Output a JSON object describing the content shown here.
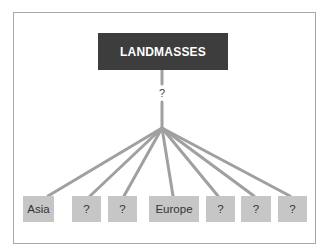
{
  "diagram": {
    "root": {
      "label": "LANDMASSES"
    },
    "relation_label": "?",
    "leaves": [
      {
        "label": "Asia"
      },
      {
        "label": "?"
      },
      {
        "label": "?"
      },
      {
        "label": "Europe"
      },
      {
        "label": "?"
      },
      {
        "label": "?"
      },
      {
        "label": "?"
      }
    ],
    "colors": {
      "root_fill": "#3d3d3d",
      "root_text": "#ffffff",
      "leaf_fill": "#c6c6c6",
      "line": "#a0a0a0",
      "frame_border": "#a8a8a8"
    }
  }
}
